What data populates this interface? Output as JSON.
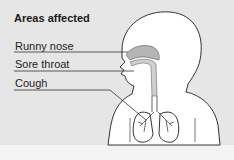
{
  "diagram": {
    "title": "Areas affected",
    "labels": [
      {
        "text": "Runny nose"
      },
      {
        "text": "Sore throat"
      },
      {
        "text": "Cough"
      }
    ],
    "colors": {
      "background": "#e6e6e6",
      "body_fill": "#ffffff",
      "outline": "#333333",
      "nasal_cavity": "#b5b5b5"
    }
  }
}
